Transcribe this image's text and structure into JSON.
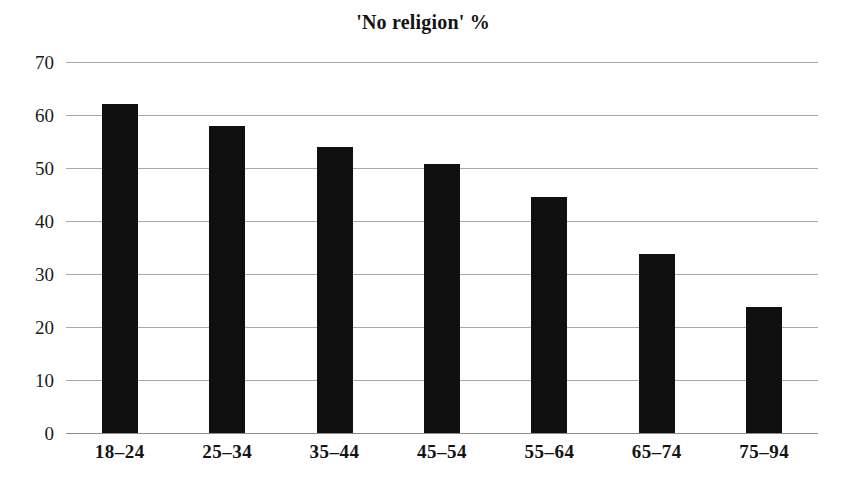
{
  "chart_data": {
    "type": "bar",
    "title": "'No religion' %",
    "xlabel": "",
    "ylabel": "",
    "categories": [
      "18–24",
      "25–34",
      "35–44",
      "45–54",
      "55–64",
      "65–74",
      "75–94"
    ],
    "values": [
      62,
      58,
      54,
      50.8,
      44.6,
      33.8,
      23.8
    ],
    "ylim": [
      0,
      70
    ],
    "ytick_labels": [
      "70",
      "60",
      "50",
      "40",
      "30",
      "20",
      "10",
      "0"
    ],
    "ytick_values": [
      70,
      60,
      50,
      40,
      30,
      20,
      10,
      0
    ],
    "grid": true,
    "legend": "none",
    "series": [
      {
        "name": "'No religion' %",
        "values": [
          62,
          58,
          54,
          50.8,
          44.6,
          33.8,
          23.8
        ]
      }
    ],
    "colors": {
      "bar": "#101010",
      "gridline": "#a9a9a9",
      "axis": "#8c8c8c",
      "text": "#141414",
      "background": "#ffffff"
    }
  }
}
